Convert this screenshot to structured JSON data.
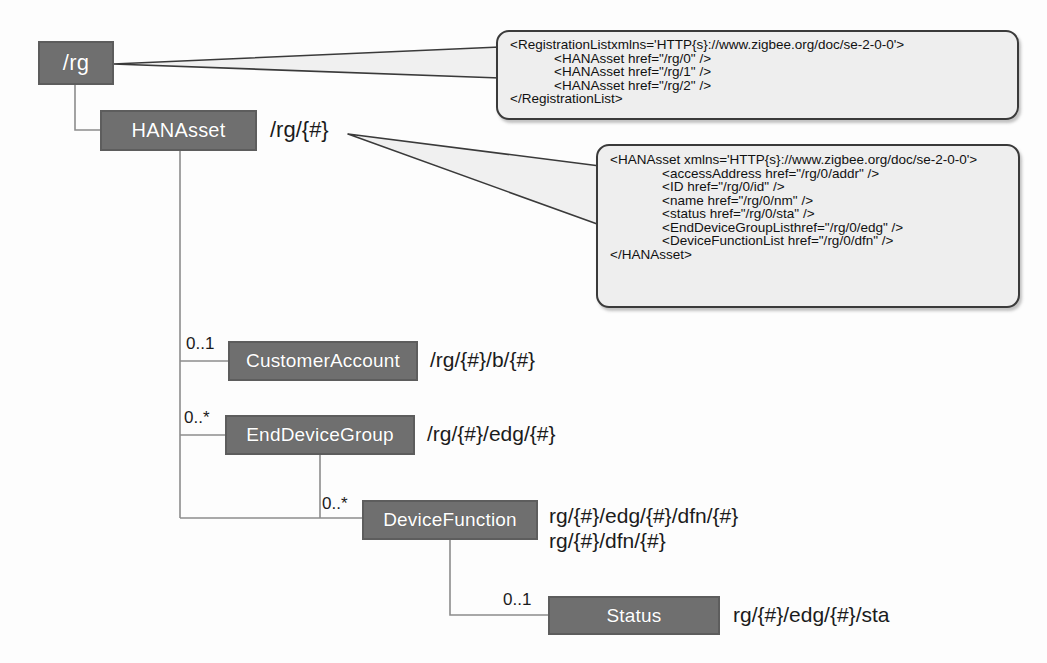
{
  "diagram": {
    "colors": {
      "node_fill": "#6f6f6f",
      "node_border": "#5d5d5d",
      "node_text": "#ffffff",
      "callout_fill": "#eeeeee",
      "callout_border": "#3a3a3a",
      "connector": "#808080",
      "background": "#fdfdfd"
    },
    "nodes": [
      {
        "id": "rg",
        "label": "/rg"
      },
      {
        "id": "hanasset",
        "label": "HANAsset"
      },
      {
        "id": "customeraccount",
        "label": "CustomerAccount"
      },
      {
        "id": "enddevicegroup",
        "label": "EndDeviceGroup"
      },
      {
        "id": "devicefunction",
        "label": "DeviceFunction"
      },
      {
        "id": "status",
        "label": "Status"
      }
    ],
    "path_labels": {
      "hanasset": "/rg/{#}",
      "customeraccount": "/rg/{#}/b/{#}",
      "enddevicegroup": "/rg/{#}/edg/{#}",
      "devicefunction_line1": "rg/{#}/edg/{#}/dfn/{#}",
      "devicefunction_line2": "rg/{#}/dfn/{#}",
      "status": "rg/{#}/edg/{#}/sta"
    },
    "multiplicities": {
      "customeraccount": "0..1",
      "enddevicegroup": "0..*",
      "devicefunction": "0..*",
      "status": "0..1"
    },
    "callouts": [
      {
        "id": "registration-list",
        "lines": [
          "<RegistrationListxmlns='HTTP{s}://www.zigbee.org/doc/se-2-0-0'>",
          "<HANAsset href=\"/rg/0\" />",
          "<HANAsset href=\"/rg/1\" />",
          "<HANAsset href=\"/rg/2\" />",
          "</RegistrationList>"
        ]
      },
      {
        "id": "hanasset-detail",
        "lines": [
          "<HANAsset xmlns='HTTP{s}://www.zigbee.org/doc/se-2-0-0'>",
          "<accessAddress href=\"/rg/0/addr\" />",
          "<ID href=\"/rg/0/id\" />",
          "<name href=\"/rg/0/nm\" />",
          "<status href=\"/rg/0/sta\" />",
          "<EndDeviceGroupListhref=\"/rg/0/edg\" />",
          "<DeviceFunctionList href=\"/rg/0/dfn\" />",
          "</HANAsset>"
        ]
      }
    ]
  }
}
